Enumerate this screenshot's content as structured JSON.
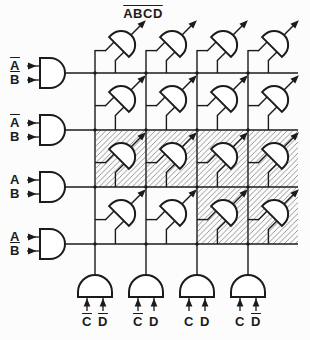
{
  "diagram": {
    "type": "4x4 AND-gate array minterm generator (Karnaugh-map style)",
    "output_label": {
      "column": 1,
      "parts": [
        {
          "c": "A",
          "b": true
        },
        {
          "c": "B",
          "b": true
        },
        {
          "c": "C",
          "b": true
        },
        {
          "c": "D",
          "b": true
        }
      ]
    },
    "row_input_gates": [
      {
        "inputs": [
          {
            "c": "A",
            "b": true
          },
          {
            "c": "B",
            "b": true
          }
        ]
      },
      {
        "inputs": [
          {
            "c": "A",
            "b": true
          },
          {
            "c": "B",
            "b": false
          }
        ]
      },
      {
        "inputs": [
          {
            "c": "A",
            "b": false
          },
          {
            "c": "B",
            "b": false
          }
        ]
      },
      {
        "inputs": [
          {
            "c": "A",
            "b": false
          },
          {
            "c": "B",
            "b": true
          }
        ]
      }
    ],
    "column_input_gates": [
      {
        "inputs": [
          {
            "c": "C",
            "b": true
          },
          {
            "c": "D",
            "b": true
          }
        ]
      },
      {
        "inputs": [
          {
            "c": "C",
            "b": true
          },
          {
            "c": "D",
            "b": false
          }
        ]
      },
      {
        "inputs": [
          {
            "c": "C",
            "b": false
          },
          {
            "c": "D",
            "b": false
          }
        ]
      },
      {
        "inputs": [
          {
            "c": "C",
            "b": false
          },
          {
            "c": "D",
            "b": true
          }
        ]
      }
    ],
    "grid": {
      "rows": 4,
      "cols": 4
    },
    "hatched_cells": [
      [
        3,
        1
      ],
      [
        3,
        2
      ],
      [
        3,
        3
      ],
      [
        3,
        4
      ],
      [
        4,
        3
      ],
      [
        4,
        4
      ]
    ]
  },
  "colors": {
    "ink": "#1b1b1b",
    "hatch": "#8a8a8a",
    "background": "#fcfcfc",
    "gate_fill": "#ffffff"
  }
}
